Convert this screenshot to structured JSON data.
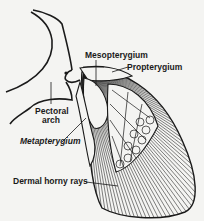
{
  "diagram": {
    "labels": {
      "mesopterygium": "Mesopterygium",
      "propterygium": "Propterygium",
      "pectoral_arch_line1": "Pectoral",
      "pectoral_arch_line2": "arch",
      "metapterygium": "Metapterygium",
      "dermal_horny_rays": "Dermal horny rays"
    },
    "colors": {
      "ink": "#1a1a1a",
      "paper": "#f4f4f2"
    }
  }
}
